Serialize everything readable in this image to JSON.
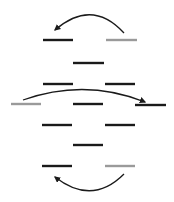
{
  "colors": {
    "black_bar": "#1a1a1a",
    "gray_bar": "#9a9a9a",
    "arrow": "#1a1a1a"
  },
  "bars": [
    {
      "x1": 43,
      "x2": 73,
      "y": 40,
      "tone": "black"
    },
    {
      "x1": 106,
      "x2": 137,
      "y": 40,
      "tone": "gray"
    },
    {
      "x1": 73,
      "x2": 104,
      "y": 63,
      "tone": "black"
    },
    {
      "x1": 43,
      "x2": 73,
      "y": 84,
      "tone": "black"
    },
    {
      "x1": 105,
      "x2": 135,
      "y": 84,
      "tone": "black"
    },
    {
      "x1": 11,
      "x2": 41,
      "y": 104,
      "tone": "gray"
    },
    {
      "x1": 73,
      "x2": 103,
      "y": 104,
      "tone": "black"
    },
    {
      "x1": 135,
      "x2": 166,
      "y": 105,
      "tone": "black"
    },
    {
      "x1": 42,
      "x2": 72,
      "y": 125,
      "tone": "black"
    },
    {
      "x1": 105,
      "x2": 135,
      "y": 125,
      "tone": "black"
    },
    {
      "x1": 73,
      "x2": 103,
      "y": 145,
      "tone": "black"
    },
    {
      "x1": 42,
      "x2": 72,
      "y": 166,
      "tone": "black"
    },
    {
      "x1": 105,
      "x2": 135,
      "y": 166,
      "tone": "gray"
    }
  ],
  "arrows": [
    {
      "d": "M124,33 Q92,-2 55,30",
      "head": [
        55,
        30,
        -135
      ]
    },
    {
      "d": "M23,100 Q85,78 145,102",
      "head": [
        145,
        102,
        25
      ]
    },
    {
      "d": "M124,174 Q92,206 55,177",
      "head": [
        55,
        177,
        135
      ]
    }
  ]
}
